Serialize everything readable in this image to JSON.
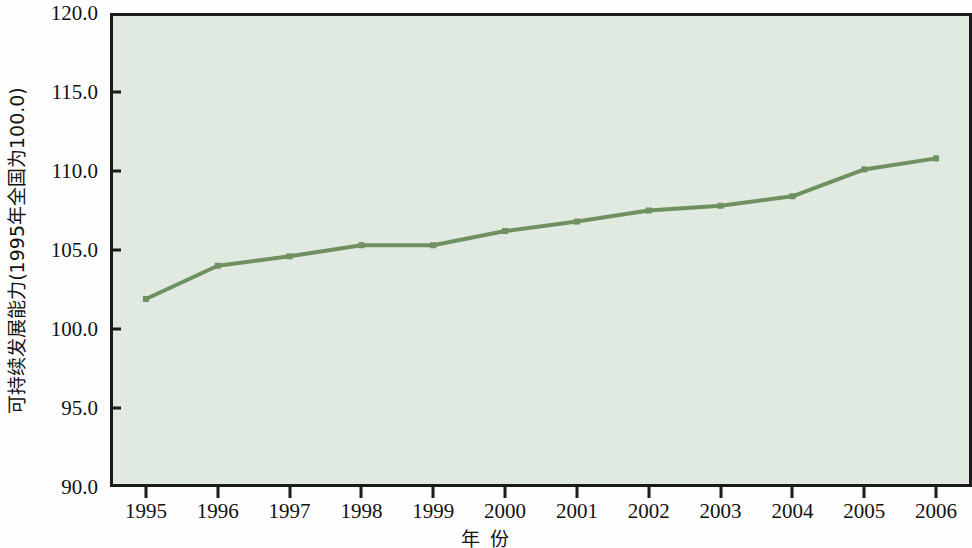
{
  "chart_data": {
    "type": "line",
    "title": "",
    "xlabel": "年 份",
    "ylabel": "可持续发展能力(1995年全国为100.0)",
    "categories": [
      "1995",
      "1996",
      "1997",
      "1998",
      "1999",
      "2000",
      "2001",
      "2002",
      "2003",
      "2004",
      "2005",
      "2006"
    ],
    "x": [
      1995,
      1996,
      1997,
      1998,
      1999,
      2000,
      2001,
      2002,
      2003,
      2004,
      2005,
      2006
    ],
    "series": [
      {
        "name": "可持续发展能力",
        "values": [
          101.9,
          104.0,
          104.6,
          105.3,
          105.3,
          106.2,
          106.8,
          107.5,
          107.8,
          108.4,
          110.1,
          110.8
        ]
      }
    ],
    "ylim": [
      90.0,
      120.0
    ],
    "ytick_labels": [
      "120.0",
      "115.0",
      "110.0",
      "105.0",
      "100.0",
      "95.0",
      "90.0"
    ],
    "yticks": [
      120.0,
      115.0,
      110.0,
      105.0,
      100.0,
      95.0,
      90.0
    ],
    "xlim": [
      1994.5,
      2006.5
    ],
    "grid": false,
    "legend": "none",
    "colors": {
      "line": "#6f9060",
      "marker": "#6f9060",
      "plot_background": "#dde7dc",
      "frame": "#1b1b1b",
      "page_background": "#fdfdfd",
      "text": "#121212"
    }
  }
}
